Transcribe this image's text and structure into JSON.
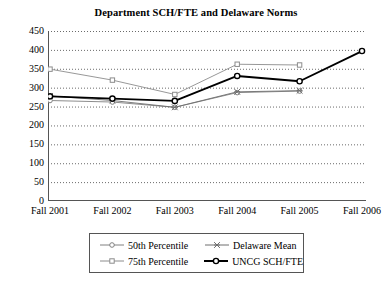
{
  "chart_data": {
    "type": "line",
    "title": "Department SCH/FTE and Delaware Norms",
    "xlabel": "",
    "ylabel": "",
    "categories": [
      "Fall 2001",
      "Fall 2002",
      "Fall 2003",
      "Fall 2004",
      "Fall 2005",
      "Fall 2006"
    ],
    "ylim": [
      0,
      450
    ],
    "ytick_step": 50,
    "yticks": [
      450,
      400,
      350,
      300,
      250,
      200,
      150,
      100,
      50,
      0
    ],
    "grid": "horizontal-dotted",
    "legend_position": "bottom",
    "series": [
      {
        "name": "50th Percentile",
        "marker": "open-circle",
        "line_style": "thin-solid",
        "color": "#808080",
        "values": [
          266,
          262,
          248,
          287,
          291,
          null
        ]
      },
      {
        "name": "75th Percentile",
        "marker": "open-square",
        "line_style": "thin-solid",
        "color": "#8c8c8c",
        "values": [
          349,
          320,
          282,
          362,
          360,
          null
        ]
      },
      {
        "name": "Delaware Mean",
        "marker": "cross-x",
        "line_style": "thin-solid",
        "color": "#6e6e6e",
        "values": [
          278,
          266,
          248,
          289,
          292,
          null
        ]
      },
      {
        "name": "UNCG SCH/FTE",
        "marker": "open-circle",
        "line_style": "thick-solid",
        "color": "#000000",
        "values": [
          277,
          271,
          265,
          331,
          317,
          397
        ]
      }
    ]
  }
}
